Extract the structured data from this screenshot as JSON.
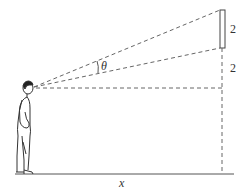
{
  "diagram": {
    "type": "geometry-viewing-angle",
    "labels": {
      "screen_height": "2",
      "gap_height": "2",
      "angle": "θ",
      "distance": "x"
    },
    "colors": {
      "line": "#555555",
      "dashed": "#666666",
      "text": "#333333",
      "background": "#ffffff"
    }
  }
}
